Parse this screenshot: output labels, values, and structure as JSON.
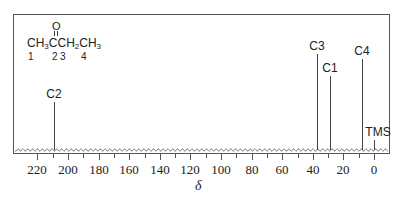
{
  "chart_data": {
    "type": "line",
    "molecule": {
      "formula_parts": [
        "CH",
        "3",
        "CCH",
        "2",
        "CH",
        "3"
      ],
      "carbonyl_oxygen": "O",
      "carbon_numbers": [
        "1",
        "2",
        "3",
        "4"
      ]
    },
    "xlabel": "δ",
    "ylabel": "",
    "xlim": [
      230,
      -5
    ],
    "x_reversed": true,
    "xticks": [
      220,
      200,
      180,
      160,
      140,
      120,
      100,
      80,
      60,
      40,
      20,
      0
    ],
    "minor_tick_step": 10,
    "grid": false,
    "baseline_style": "wavy noise",
    "peaks": [
      {
        "label": "C2",
        "shift_ppm": 209,
        "relative_height": 0.37
      },
      {
        "label": "C3",
        "shift_ppm": 37,
        "relative_height": 0.74
      },
      {
        "label": "C1",
        "shift_ppm": 29,
        "relative_height": 0.57
      },
      {
        "label": "C4",
        "shift_ppm": 8,
        "relative_height": 0.7
      },
      {
        "label": "TMS",
        "shift_ppm": 0,
        "relative_height": 0.08
      }
    ]
  }
}
